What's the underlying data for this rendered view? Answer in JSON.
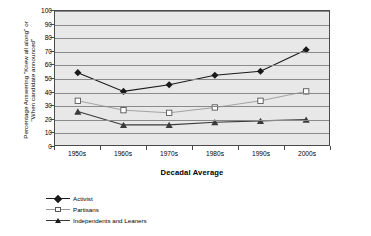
{
  "chart_data": {
    "type": "line",
    "title": "",
    "xlabel": "Decadal Average",
    "ylabel_line1": "Percentage Answering \"Knew all along\" or",
    "ylabel_line2": "\"When candidate announced\"",
    "categories": [
      "1950s",
      "1960s",
      "1970s",
      "1980s",
      "1990s",
      "2000s"
    ],
    "ylim": [
      0,
      100
    ],
    "yticks": [
      0,
      10,
      20,
      30,
      40,
      50,
      60,
      70,
      80,
      90,
      100
    ],
    "grid": true,
    "legend_position": "bottom-left",
    "series": [
      {
        "name": "Activist",
        "marker": "filled-diamond",
        "color": "#1a1a1a",
        "values": [
          54,
          40,
          45,
          52,
          55,
          71
        ]
      },
      {
        "name": "Partisans",
        "marker": "open-square",
        "color": "#9a9a9a",
        "values": [
          33,
          26,
          24,
          28,
          33,
          40
        ]
      },
      {
        "name": "Independents and Leaners",
        "marker": "filled-triangle",
        "color": "#3a3a3a",
        "values": [
          25,
          15,
          15,
          17,
          18,
          19
        ]
      }
    ]
  },
  "legend": {
    "items": [
      {
        "label": "Activist"
      },
      {
        "label": "Partisans"
      },
      {
        "label": "Independents and Leaners"
      }
    ]
  }
}
